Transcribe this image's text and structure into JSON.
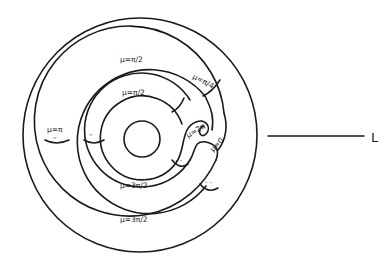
{
  "figure": {
    "type": "nested annular strips (Riemann surface / phase diagram)",
    "colors": {
      "ink": "#1a1a1a",
      "background": "#ffffff"
    }
  },
  "labels": {
    "outer_band_top": "μ=π/2",
    "inner_band_top": "μ=π/2",
    "right_band": "μ=π/4",
    "left_band": "μ=π",
    "twist_upper": "μ=2π",
    "twist_lower": "μ=0",
    "inner_band_bottom": "μ=3π/2",
    "outer_band_bottom": "μ=3π/2",
    "left_mark": "–",
    "inner_left_mark": "–",
    "mark_dots_1": "· ·",
    "mark_dots_2": "· ·",
    "line_label": "L"
  }
}
